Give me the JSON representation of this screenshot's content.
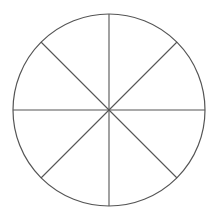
{
  "diagram": {
    "type": "circle-divided-into-sectors",
    "sectors": 8,
    "center": [
      109,
      110
    ],
    "radius": 96,
    "stroke_color": "#555555",
    "line_angles_deg": [
      0,
      45,
      90,
      135
    ]
  }
}
